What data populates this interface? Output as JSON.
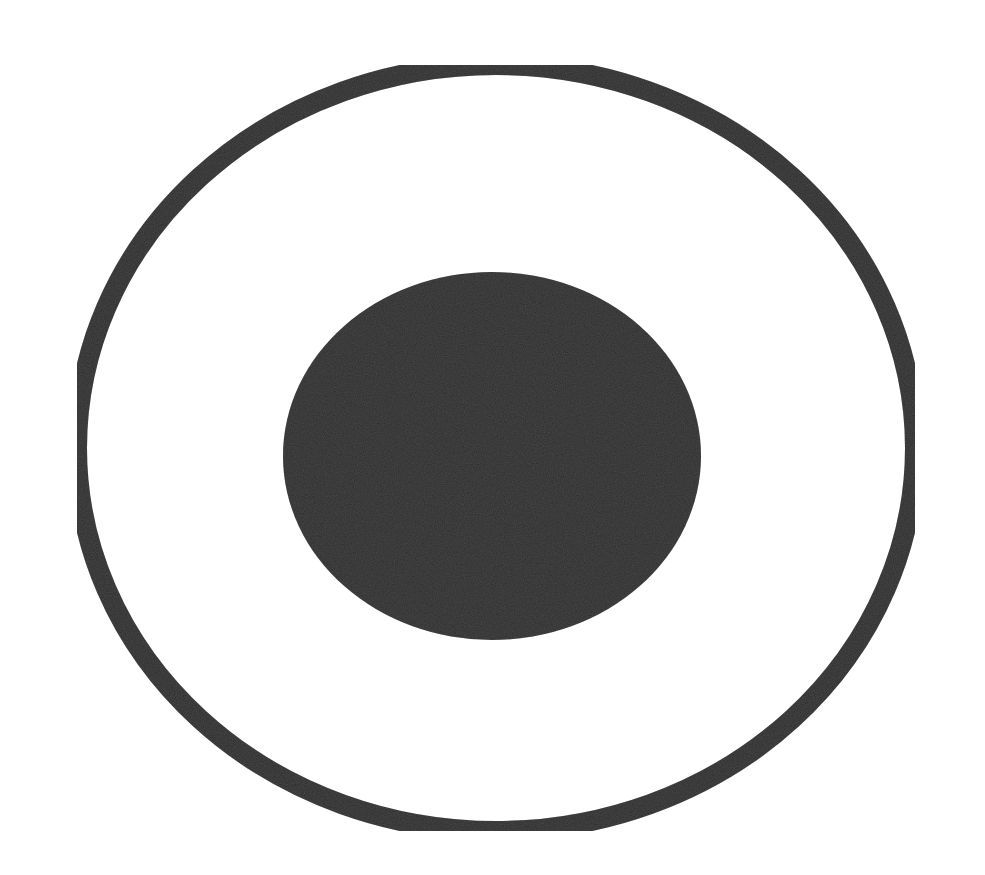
{
  "figure": {
    "background_color": "#ffffff",
    "ink_color": "#2b2b2b",
    "outer_ring": {
      "cx": 496,
      "cy": 448,
      "rx": 419,
      "ry": 383,
      "stroke_width": 20
    },
    "inner_dot": {
      "cx": 492,
      "cy": 456,
      "rx": 209,
      "ry": 184
    }
  }
}
